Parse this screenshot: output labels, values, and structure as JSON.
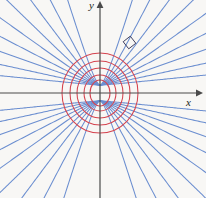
{
  "figure": {
    "name": "orthogonal-trajectories-confocal-conics",
    "background_color": "#f8f7f5"
  },
  "axes": {
    "x_label": "x",
    "y_label": "y",
    "axis_color": "#4a4a4a",
    "origin": {
      "x": 100,
      "y": 93
    },
    "x_axis": {
      "x_start": 0,
      "x_end": 196,
      "arrow": "right"
    },
    "y_axis": {
      "y_start": 190,
      "y_end": 8,
      "arrow": "up"
    }
  },
  "chart_data": {
    "type": "line",
    "title": "",
    "subtitle": "",
    "xlabel": "x",
    "ylabel": "y",
    "xlim": [
      -100,
      106
    ],
    "ylim": [
      -105,
      93
    ],
    "grid": false,
    "legend": null,
    "annotations": [
      {
        "name": "right-angle-marker",
        "kind": "right-angle-square",
        "x": 125,
        "y": 38,
        "size": 9,
        "rotation_deg": -38,
        "color": "#3d3d5c",
        "meaning": "curves intersect orthogonally"
      }
    ],
    "foci": [
      {
        "x": 0,
        "y": 8
      },
      {
        "x": 0,
        "y": -8
      }
    ],
    "series": [
      {
        "name": "ellipses",
        "family": "confocal ellipses",
        "color": "#d4434f",
        "count": 5,
        "semi_axes": [
          {
            "a": 10,
            "b": 13
          },
          {
            "a": 16,
            "b": 18
          },
          {
            "a": 23,
            "b": 25
          },
          {
            "a": 30,
            "b": 32
          },
          {
            "a": 38,
            "b": 40
          }
        ]
      },
      {
        "name": "hyperbolas",
        "family": "confocal hyperbolas",
        "color": "#6b8ed0",
        "count": 9,
        "slopes": [
          0.1,
          0.22,
          0.36,
          0.52,
          0.72,
          0.98,
          1.35,
          1.95,
          3.2
        ]
      }
    ]
  }
}
